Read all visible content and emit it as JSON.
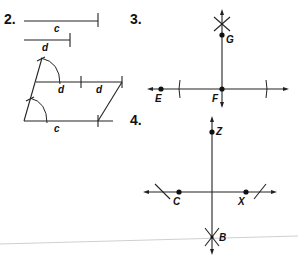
{
  "problems": [
    {
      "number": "2.",
      "segments": {
        "c_label": "c",
        "d_label": "d"
      },
      "parallelogram": {
        "top_labels": [
          "d",
          "d"
        ],
        "bottom_label": "c"
      }
    },
    {
      "number": "3.",
      "points": {
        "E": "E",
        "F": "F",
        "G": "G"
      }
    },
    {
      "number": "4.",
      "points": {
        "Z": "Z",
        "C": "C",
        "X": "X",
        "B": "B"
      }
    }
  ],
  "colors": {
    "ink": "#222222",
    "page_edge": "#c8c8c8"
  }
}
